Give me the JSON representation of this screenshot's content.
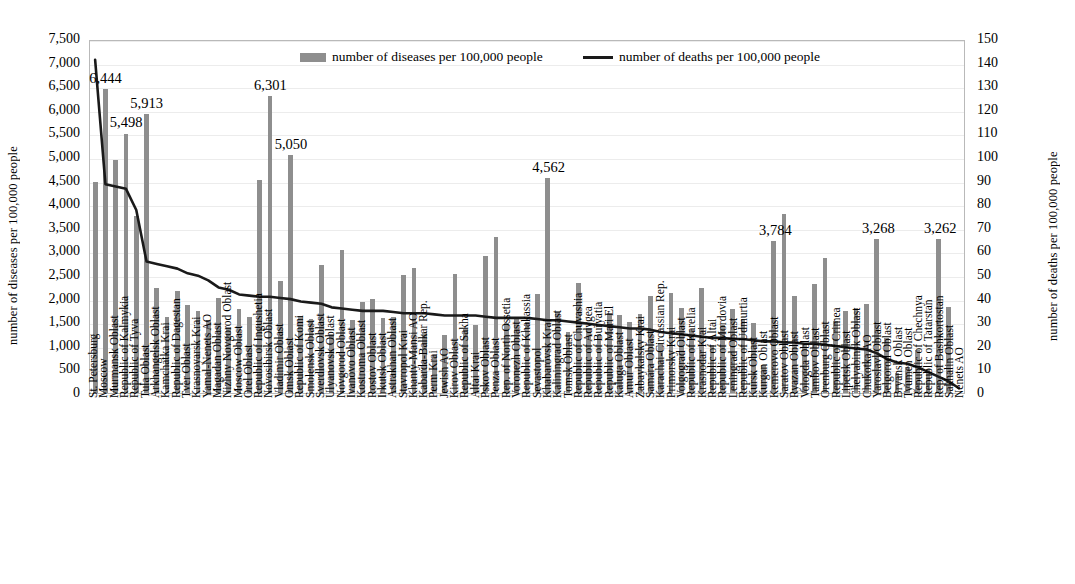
{
  "axes": {
    "left_title": "number of diseases per 100,000 people",
    "right_title": "number of deaths per 100,000 people",
    "left_ticks": [
      "7,500",
      "7,000",
      "6,500",
      "6,000",
      "5,500",
      "5,000",
      "4,500",
      "4,000",
      "3,500",
      "3,000",
      "2,500",
      "2,000",
      "1,500",
      "1,000",
      "500",
      "0"
    ],
    "right_ticks": [
      "150",
      "140",
      "130",
      "120",
      "110",
      "100",
      "90",
      "80",
      "70",
      "60",
      "50",
      "40",
      "30",
      "20",
      "10",
      "0"
    ]
  },
  "legend": {
    "bar_label": "number of diseases per 100,000 people",
    "line_label": "number of deaths per 100,000 people",
    "bar_color": "#8e8e8e",
    "line_color": "#1a1a1a"
  },
  "chart_data": {
    "type": "bar",
    "title": "",
    "xlabel": "",
    "ylabel": "number of diseases per 100,000 people",
    "y2label": "number of deaths per 100,000 people",
    "ylim": [
      0,
      7500
    ],
    "y2lim": [
      0,
      150
    ],
    "grid": true,
    "legend_position": "top-center",
    "categories": [
      "St. Petersburg",
      "Moscow",
      "Murmansk Oblast",
      "Republic of Kalmykia",
      "Republic of Tyva",
      "Tula Oblast",
      "Arkhangelsk Oblast",
      "Kamchatka Krai",
      "Republic of Dagestan",
      "Tver Oblast",
      "Krasnoyarsk Krai",
      "Yamal-Nenets AO",
      "Magadan Oblast",
      "Nizhny Novgorod Oblast",
      "Moscow Oblast",
      "Orel Oblast",
      "Republic of Ingushetia",
      "Novosibirsk Oblast",
      "Vladimir Oblast",
      "Omsk Oblast",
      "Republic of Komi",
      "Smolensk Oblast",
      "Sverdlovsk Oblast",
      "Ulyanovsk Oblast",
      "Novgorod Oblast",
      "Ivanovo Oblast",
      "Kostroma Oblast",
      "Rostov Oblast",
      "Irkutsk Oblast",
      "Astrakhan Oblast",
      "Stavropol Krai",
      "Khanty-Mansi AO",
      "Kabarda-Balkar Rep.",
      "Perm Krai",
      "Jewish AO",
      "Kirov Oblast",
      "Republic of Sakha",
      "Altai Krai",
      "Pskov Oblast",
      "Penza Oblast",
      "Rep. of North Ossetia",
      "Voronezh Oblast",
      "Republic of Khakassia",
      "Sevastopol",
      "Khabarovsk Krai",
      "Kaliningrad Oblast",
      "Tomsk Oblast",
      "Republic of Chuvashia",
      "Republic of Adygea",
      "Republic of Buryatia",
      "Republic of Mari El",
      "Kaluga Oblast",
      "Amur Oblast",
      "Zabaykalsky Krai",
      "Samara Oblast",
      "Karachai-Circassian Rep.",
      "Primorsky Krai",
      "Volgograd Oblast",
      "Republic of Karelia",
      "Krasnodar Krai",
      "Republic of Altai",
      "Republic of Mordovia",
      "Leningrad Oblast",
      "Republic of Udmurtia",
      "Kursk Oblast",
      "Kurgan Oblast",
      "Kemerovo Oblast",
      "Saratov Oblast",
      "Ryazan Oblast",
      "Vologda Oblast",
      "Tambov Oblast",
      "Orenburg Oblast",
      "Republic of Crimea",
      "Lipetsk Oblast",
      "Chelyabinsk Oblast",
      "Chukotka AO",
      "Yaroslavl Oblast",
      "Belgorod Oblast",
      "Bryansk Oblast",
      "Tyumen Oblast",
      "Republic of Chechnya",
      "Republic of Tatarstan",
      "Rep. of Bashkortostan",
      "Sakhalin Oblast",
      "Nenets AO"
    ],
    "series": [
      {
        "name": "number of diseases per 100,000 people",
        "axis": "left",
        "kind": "bar",
        "color": "#8e8e8e",
        "values": [
          4480,
          6444,
          4940,
          5498,
          3760,
          5913,
          2220,
          1620,
          2170,
          1870,
          1730,
          1540,
          2010,
          1400,
          1780,
          1610,
          4520,
          6301,
          2370,
          5050,
          1640,
          1560,
          2720,
          1260,
          3020,
          1540,
          1930,
          2000,
          1580,
          1620,
          2500,
          2640,
          1300,
          800,
          1230,
          2530,
          1350,
          1450,
          2900,
          3310,
          1480,
          1620,
          1500,
          2100,
          4562,
          1720,
          1290,
          2340,
          1380,
          1240,
          1700,
          1650,
          1500,
          1680,
          2050,
          1060,
          2120,
          1800,
          1330,
          2230,
          1020,
          1440,
          1770,
          1570,
          1490,
          600,
          3220,
          3784,
          2060,
          1030,
          2300,
          2870,
          1520,
          1730,
          1800,
          1880,
          3268,
          1160,
          430,
          560,
          920,
          500,
          3262,
          1830,
          0
        ]
      },
      {
        "name": "number of deaths per 100,000 people",
        "axis": "right",
        "kind": "line",
        "color": "#1a1a1a",
        "values": [
          142,
          89,
          88,
          87,
          78,
          56,
          55,
          54,
          53,
          51,
          50,
          48,
          45,
          44,
          42,
          41.5,
          41,
          41,
          40.5,
          40,
          39,
          38.5,
          38,
          36.5,
          36,
          35.5,
          35,
          35,
          35,
          34.5,
          34,
          34,
          34,
          33.5,
          33,
          33,
          33,
          33,
          32.5,
          32,
          32,
          32,
          32,
          31.5,
          31,
          31,
          30.5,
          30,
          29.5,
          29,
          28.5,
          28,
          27.5,
          27.5,
          27,
          26,
          25.5,
          25,
          24.5,
          24,
          23.5,
          23.5,
          23,
          23,
          22.5,
          22,
          22,
          21.5,
          21.5,
          21,
          21,
          20.5,
          20,
          19.5,
          19,
          18.5,
          17,
          14.5,
          13,
          12.5,
          11,
          9,
          7,
          5,
          2
        ]
      }
    ],
    "data_labels": [
      {
        "category": "Moscow",
        "value": "6,444"
      },
      {
        "category": "Republic of Kalmykia",
        "value": "5,498"
      },
      {
        "category": "Tula Oblast",
        "value": "5,913"
      },
      {
        "category": "Novosibirsk Oblast",
        "value": "6,301"
      },
      {
        "category": "Omsk Oblast",
        "value": "5,050"
      },
      {
        "category": "Khabarovsk Krai",
        "value": "4,562"
      },
      {
        "category": "Kemerovo Oblast",
        "value": "3,784"
      },
      {
        "category": "Yaroslavl Oblast",
        "value": "3,268"
      },
      {
        "category": "Rep. of Bashkortostan",
        "value": "3,262"
      }
    ]
  }
}
